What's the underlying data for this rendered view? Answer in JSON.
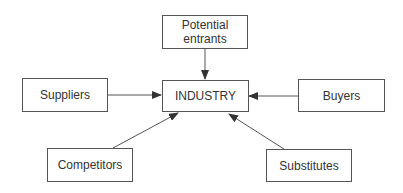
{
  "diagram": {
    "nodes": {
      "entrants": {
        "label": "Potential entrants",
        "line1": "Potential",
        "line2": "entrants"
      },
      "industry": {
        "label": "INDUSTRY"
      },
      "suppliers": {
        "label": "Suppliers"
      },
      "buyers": {
        "label": "Buyers"
      },
      "competitors": {
        "label": "Competitors"
      },
      "substitutes": {
        "label": "Substitutes"
      }
    },
    "edges": [
      {
        "from": "Potential entrants",
        "to": "INDUSTRY"
      },
      {
        "from": "Suppliers",
        "to": "INDUSTRY"
      },
      {
        "from": "Buyers",
        "to": "INDUSTRY"
      },
      {
        "from": "Competitors",
        "to": "INDUSTRY"
      },
      {
        "from": "Substitutes",
        "to": "INDUSTRY"
      }
    ],
    "colors": {
      "stroke": "#555555",
      "text": "#333333",
      "background": "#ffffff"
    }
  }
}
